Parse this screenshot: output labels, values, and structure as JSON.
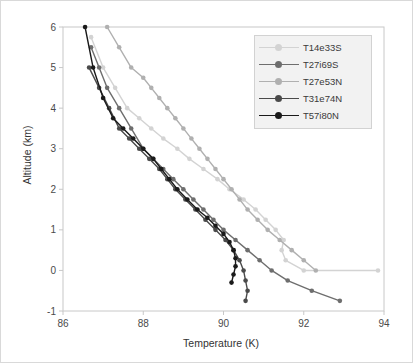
{
  "chart_data": {
    "type": "line",
    "title": "",
    "xlabel": "Temperature (K)",
    "ylabel": "Altitude (km)",
    "xlim": [
      86,
      94
    ],
    "ylim": [
      -1,
      6
    ],
    "xticks": [
      86,
      88,
      90,
      92,
      94
    ],
    "yticks": [
      -1,
      0,
      1,
      2,
      3,
      4,
      5,
      6
    ],
    "grid": false,
    "legend_position": "top-right",
    "series": [
      {
        "name": "T14e33S",
        "color": "#d3d3d3",
        "marker": "circle",
        "x": [
          93.85,
          92.0,
          91.55,
          91.45,
          91.5,
          91.3,
          91.05,
          90.8,
          90.5,
          90.15,
          89.85,
          89.5,
          89.15,
          88.85,
          88.5,
          88.2,
          87.9,
          87.6,
          87.3,
          87.0,
          86.7
        ],
        "y": [
          0.0,
          0.0,
          0.25,
          0.5,
          0.75,
          1.0,
          1.25,
          1.5,
          1.75,
          2.0,
          2.25,
          2.5,
          2.75,
          3.0,
          3.25,
          3.5,
          3.75,
          4.0,
          4.5,
          5.0,
          5.75
        ]
      },
      {
        "name": "T27i69S",
        "color": "#6e6e6e",
        "marker": "circle",
        "x": [
          92.9,
          92.2,
          91.6,
          91.2,
          90.9,
          90.6,
          90.3,
          90.0,
          89.75,
          89.5,
          89.25,
          89.0,
          88.75,
          88.5,
          88.25,
          88.0,
          87.7,
          87.4,
          87.1,
          86.9,
          86.7
        ],
        "y": [
          -0.75,
          -0.5,
          -0.25,
          0.0,
          0.25,
          0.5,
          0.75,
          1.0,
          1.25,
          1.5,
          1.75,
          2.0,
          2.25,
          2.5,
          2.75,
          3.0,
          3.5,
          4.0,
          4.5,
          5.0,
          5.5
        ]
      },
      {
        "name": "T27e53N",
        "color": "#b0b0b0",
        "marker": "circle",
        "x": [
          92.3,
          92.0,
          91.7,
          91.4,
          91.1,
          90.85,
          90.6,
          90.4,
          90.2,
          90.0,
          89.8,
          89.6,
          89.4,
          89.2,
          89.0,
          88.8,
          88.6,
          88.4,
          88.2,
          88.0,
          87.7,
          87.4,
          87.1
        ],
        "y": [
          0.0,
          0.25,
          0.5,
          0.75,
          1.0,
          1.25,
          1.5,
          1.75,
          2.0,
          2.25,
          2.5,
          2.75,
          3.0,
          3.25,
          3.5,
          3.75,
          4.0,
          4.25,
          4.5,
          4.75,
          5.0,
          5.5,
          6.0
        ]
      },
      {
        "name": "T31e74N",
        "color": "#4a4a4a",
        "marker": "circle",
        "x": [
          90.55,
          90.6,
          90.55,
          90.5,
          90.4,
          90.25,
          90.05,
          89.8,
          89.55,
          89.3,
          89.05,
          88.8,
          88.6,
          88.4,
          88.15,
          87.9,
          87.65,
          87.4,
          87.15,
          86.9,
          86.65
        ],
        "y": [
          -0.75,
          -0.5,
          -0.25,
          0.0,
          0.25,
          0.5,
          0.75,
          1.0,
          1.25,
          1.5,
          1.75,
          2.0,
          2.25,
          2.5,
          2.75,
          3.0,
          3.25,
          3.5,
          4.0,
          4.5,
          5.0
        ]
      },
      {
        "name": "T57i80N",
        "color": "#1a1a1a",
        "marker": "circle",
        "x": [
          90.2,
          90.25,
          90.3,
          90.3,
          90.25,
          90.15,
          90.0,
          89.8,
          89.6,
          89.35,
          89.1,
          88.85,
          88.65,
          88.45,
          88.25,
          88.0,
          87.75,
          87.5,
          87.25,
          87.0,
          86.75,
          86.55
        ],
        "y": [
          -0.3,
          -0.1,
          0.1,
          0.3,
          0.5,
          0.7,
          0.9,
          1.1,
          1.3,
          1.5,
          1.75,
          2.0,
          2.25,
          2.5,
          2.75,
          3.0,
          3.25,
          3.5,
          3.75,
          4.25,
          5.0,
          6.0
        ]
      }
    ]
  },
  "legend": {
    "items": [
      {
        "label": "T14e33S"
      },
      {
        "label": "T27i69S"
      },
      {
        "label": "T27e53N"
      },
      {
        "label": "T31e74N"
      },
      {
        "label": "T57i80N"
      }
    ]
  },
  "axes": {
    "xlabel": "Temperature (K)",
    "ylabel": "Altitude (km)",
    "xticks": [
      "86",
      "88",
      "90",
      "92",
      "94"
    ],
    "yticks": [
      "6",
      "5",
      "4",
      "3",
      "2",
      "1",
      "0",
      "-1"
    ]
  }
}
